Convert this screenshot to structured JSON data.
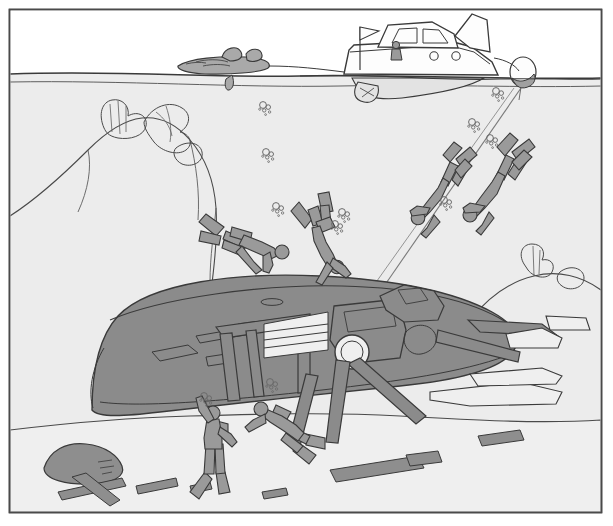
{
  "illustration": {
    "title": "Scuba divers exploring a sunken shipwreck",
    "style": "black-and-white line drawing with gray tonal fills",
    "frame": {
      "name": "picture-border",
      "x": 9,
      "y": 9,
      "width": 592,
      "height": 504,
      "stroke": "#4a4a4a",
      "stroke_width": 1.6,
      "fill": "#ffffff"
    },
    "palette": {
      "sky": "#ffffff",
      "water": "#ececec",
      "water_deep": "#eeeeee",
      "seabed": "#efefef",
      "wreck_fill": "#8b8b8b",
      "wreck_fill_dark": "#7d7d7d",
      "rock_fill": "#8e8e8e",
      "diver_fill": "#9a9a9a",
      "boat_fill": "#fdfdfd",
      "dinghy_fill": "#a9a9a9",
      "buoy_fill": "#a0a0a0",
      "line": "#3a3a3a",
      "line_soft": "#5e5e5e",
      "bubble": "#6a6a6a"
    }
  },
  "regions": [
    {
      "name": "sky-region",
      "label": "Sky above waterline",
      "y_range": [
        10,
        76
      ]
    },
    {
      "name": "water-region",
      "label": "Open water column",
      "y_range": [
        76,
        300
      ]
    },
    {
      "name": "seabed-region",
      "label": "Sea floor",
      "y_range": [
        300,
        512
      ]
    }
  ],
  "surface": {
    "name": "waterline",
    "label": "Water surface line",
    "left_y": 72,
    "right_y": 80,
    "path": "M10,74 C120,70 210,78 300,76 C400,74 500,80 601,78"
  },
  "boat": {
    "name": "dive-boat",
    "label": "Motor cruiser / dive boat",
    "hull_path": "M345,76 L353,47 L356,44 L446,41 L470,47 L490,62 L497,76 Z",
    "cabin_path": "M380,44 L388,26 L432,23 L452,34 L455,45",
    "window_paths": [
      "M392,41 L398,29 L418,28 L418,41 Z",
      "M424,41 L424,29 L440,30 L448,41 Z"
    ],
    "portholes": [
      {
        "cx": 434,
        "cy": 55,
        "r": 4.2
      },
      {
        "cx": 456,
        "cy": 55,
        "r": 4.2
      }
    ],
    "fin_path": "M455,36 L472,16 L486,22 L488,50 L470,47 Z",
    "flag": {
      "mast": "M360,72 L360,28",
      "banner": "M360,28 L378,32 L360,40 Z"
    },
    "person": {
      "name": "boat-skipper",
      "head": {
        "cx": 396,
        "cy": 46,
        "r": 3.4
      },
      "body": "M392,50 L391,60 L401,60 L400,50 Z"
    },
    "underwater_hull": "M352,78 C360,96 372,100 400,97 C430,93 470,86 480,78",
    "propeller": "M360,82 L356,95 L372,97 L376,84",
    "tow_rope": "M290,72 C320,72 336,74 348,74"
  },
  "dinghy": {
    "name": "inflatable-dinghy",
    "label": "Towed inflatable dinghy with gear",
    "hull_path": "M178,66 C190,59 220,57 245,58 C262,59 270,63 268,68 C266,72 230,74 205,73 C188,72 178,70 178,66 Z",
    "gear_paths": [
      "M222,57 C225,48 236,46 240,52 C243,58 238,60 230,60 Z",
      "M246,54 C251,48 260,49 261,55 C262,61 252,62 247,60 Z",
      "M196,63 C204,60 216,60 222,63",
      "M204,66 C212,64 222,64 228,66"
    ],
    "rudder_path": "M232,74 C234,82 232,88 228,89 C225,90 224,84 226,78"
  },
  "buoy": {
    "name": "marker-buoy",
    "label": "Surface marker buoy",
    "ellipse": {
      "cx": 523,
      "cy": 73,
      "rx": 13,
      "ry": 15
    },
    "tether": "M524,88 L520,100",
    "boat_line": "M497,60 C508,62 516,66 520,72"
  },
  "descent_lines": [
    {
      "name": "descent-line-primary",
      "path": "M521,88 L380,292"
    },
    {
      "name": "descent-line-secondary",
      "path": "M514,88 L362,300"
    }
  ],
  "divers": [
    {
      "name": "diver-descending-upper-right",
      "label": "Diver descending head-down on the line",
      "position": [
        500,
        150
      ],
      "orientation": "head-down, finning",
      "body_path": "M508,174 L504,190 L492,206 L486,216 L478,222 L472,216 L480,206 L490,192 L496,176 Z",
      "head": {
        "cx": 471,
        "cy": 214,
        "r": 7
      },
      "tank": "M510,162 L520,152 L527,158 L517,170 Z",
      "fins": [
        "M512,152 L528,140 L534,147 L518,160 Z",
        "M498,148 L510,134 L517,140 L505,156 Z"
      ],
      "arms": [
        "M484,204 L470,202 L464,208",
        "M490,212 L482,224 L476,230"
      ]
    },
    {
      "name": "diver-descending-upper-left",
      "label": "Second diver descending beside the line",
      "position": [
        450,
        160
      ],
      "orientation": "head-down",
      "body_path": "M452,180 L447,196 L438,210 L432,218 L425,222 L420,216 L428,207 L436,194 L442,180 Z",
      "head": {
        "cx": 420,
        "cy": 213,
        "r": 6.6
      },
      "tank": "M454,170 L463,160 L470,166 L460,177 Z",
      "fins": [
        "M456,160 L470,148 L476,155 L462,167 Z",
        "M444,156 L454,143 L461,149 L450,162 Z"
      ],
      "arms": [
        "M430,206 L418,204 L412,210",
        "M434,216 L428,227 L422,232"
      ]
    },
    {
      "name": "diver-swimming-horizontal-mid",
      "label": "Diver swimming horizontally above the wreck",
      "position": [
        250,
        240
      ],
      "orientation": "horizontal, head right",
      "body_path": "M226,232 L244,236 L262,242 L272,246 L276,252 L268,256 L252,250 L234,244 L224,239 Z",
      "head": {
        "cx": 279,
        "cy": 251,
        "r": 7
      },
      "tank": "M232,228 L250,232 L252,240 L234,236 Z",
      "fins": [
        "M222,228 L206,216 L200,224 L216,236 Z",
        "M220,238 L202,234 L200,243 L218,246 Z"
      ],
      "legs": [
        "M224,240 L240,258 L252,266",
        "M232,244 L246,262 L258,268"
      ],
      "arms": [
        "M270,252 L272,264 L268,272"
      ]
    },
    {
      "name": "diver-vertical-mid",
      "label": "Diver swimming head-down toward wreck deck",
      "position": [
        320,
        230
      ],
      "orientation": "head-down, vertical",
      "body_path": "M322,224 L326,240 L332,252 L336,262 L330,268 L322,256 L316,240 L314,226 Z",
      "head": {
        "cx": 334,
        "cy": 266,
        "r": 6.6
      },
      "tank": "M318,222 L330,218 L334,228 L322,232 Z",
      "fins": [
        "M312,220 L300,204 L292,212 L306,228 Z",
        "M322,214 L318,196 L328,194 L332,212 Z"
      ],
      "arms": [
        "M330,258 L342,266 L348,274",
        "M326,262 L320,274 L316,280"
      ]
    },
    {
      "name": "diver-vertical-lower-left",
      "label": "Diver near sea floor with arm raised",
      "position": [
        210,
        430
      ],
      "orientation": "upright, arm raised",
      "body_path": "M208,420 L206,438 L206,454 L210,472 L216,472 L219,454 L220,436 L218,420 Z",
      "head": {
        "cx": 212,
        "cy": 414,
        "r": 7
      },
      "tank": "M216,422 L226,424 L226,438 L218,436 Z",
      "fins": [
        "M206,474 L192,492 L200,498 L212,480 Z",
        "M216,474 L218,494 L228,492 L224,474 Z"
      ],
      "arms": [
        "M208,424 L198,412 L196,400",
        "M220,428 L230,436 L234,444"
      ]
    },
    {
      "name": "diver-horizontal-lower-right",
      "label": "Diver swimming horizontally near sea floor",
      "position": [
        280,
        420
      ],
      "orientation": "horizontal, head left",
      "body_path": "M266,410 L282,416 L296,424 L306,432 L302,440 L288,432 L274,424 L262,417 Z",
      "head": {
        "cx": 262,
        "cy": 408,
        "r": 7
      },
      "tank": "M276,406 L290,412 L286,420 L272,414 Z",
      "fins": [
        "M306,436 L324,440 L324,450 L306,446 Z",
        "M300,444 L316,456 L310,464 L294,452 Z"
      ],
      "legs": [
        "M300,432 L316,440 L324,444",
        "M296,438 L310,450 L316,456"
      ],
      "arms": [
        "M264,414 L252,420 L246,426"
      ]
    }
  ],
  "bubble_clusters": [
    {
      "name": "bubble-cluster-1",
      "cx": 266,
      "cy": 155,
      "scale": 1.0
    },
    {
      "name": "bubble-cluster-2",
      "cx": 276,
      "cy": 208,
      "scale": 0.9
    },
    {
      "name": "bubble-cluster-3",
      "cx": 340,
      "cy": 214,
      "scale": 0.85
    },
    {
      "name": "bubble-cluster-4",
      "cx": 497,
      "cy": 93,
      "scale": 0.85
    },
    {
      "name": "bubble-cluster-5",
      "cx": 474,
      "cy": 124,
      "scale": 0.8
    },
    {
      "name": "bubble-cluster-6",
      "cx": 490,
      "cy": 140,
      "scale": 0.8
    },
    {
      "name": "bubble-cluster-7",
      "cx": 206,
      "cy": 398,
      "scale": 0.8
    },
    {
      "name": "bubble-cluster-8",
      "cx": 272,
      "cy": 385,
      "scale": 0.85
    },
    {
      "name": "bubble-cluster-9",
      "cx": 264,
      "cy": 108,
      "scale": 0.7
    }
  ],
  "wreck": {
    "name": "shipwreck",
    "label": "Sunken ship hull resting on the sea floor",
    "hull_path": "M92,410 C92,380 96,340 118,316 C150,282 240,272 320,276 C400,280 455,292 492,312 C512,323 520,334 516,346 C508,368 460,380 400,386 C330,393 230,404 160,412 C126,416 98,418 92,410 Z",
    "deck_line": "M108,318 C160,296 260,282 340,284 C420,286 472,300 504,320",
    "keel_line": "M100,400 C140,406 230,398 320,388",
    "hull_features": [
      "M150,350 L186,344 L196,352 L158,360 Z",
      "M206,356 L224,354 L226,362 L208,364 Z",
      "M196,336 L252,326 L254,332 L200,342 Z",
      "M238,324 L300,316 L302,322 L240,330 Z"
    ],
    "bow_path": "M92,410 C88,396 90,372 100,352",
    "structures": [
      {
        "name": "wreck-mast-frame",
        "path": "M222,328 L222,400 M300,320 L300,396 M218,326 L306,316 L306,326 L222,336 Z"
      },
      {
        "name": "wreck-beam-diagonal",
        "path": "M234,330 L246,398 M286,322 L294,392"
      },
      {
        "name": "wreck-ladder",
        "path": "M262,322 L262,356 L326,348 L326,312 M262,330 L326,322 M262,338 L326,330 M262,346 L326,338"
      },
      {
        "name": "wreck-hatch-ring",
        "cx": 350,
        "cy": 352,
        "r": 17
      },
      {
        "name": "wreck-superstructure",
        "path": "M336,306 L398,300 L404,332 L398,356 L344,362 L332,340 Z"
      },
      {
        "name": "wreck-davit",
        "path": "M382,296 L404,286 L432,292 L442,306 L436,318 L404,320 Z"
      },
      {
        "name": "wreck-boom-fallen",
        "path": "M352,366 L418,424 L426,418 L362,360 Z"
      },
      {
        "name": "wreck-boom-fallen-2",
        "path": "M338,360 L330,440 L340,440 L350,362 Z"
      },
      {
        "name": "wreck-spar-right",
        "path": "M440,330 L518,352 L520,360 L440,340 Z"
      },
      {
        "name": "wreck-rail-right",
        "path": "M470,322 L540,326 L556,336 L482,332 Z"
      }
    ],
    "debris_right": [
      "M430,392 L520,384 L560,392 L556,402 L470,404 L430,400 Z",
      "M470,376 L540,370 L560,376 L556,382 L478,384 Z",
      "M508,336 L540,330 L560,338 L558,346 L512,346 Z",
      "M546,318 L584,320 L588,330 L550,330 Z"
    ],
    "winch_path": "M404,330 C412,322 426,322 432,330 C438,338 432,350 420,352 C408,354 398,342 404,330 Z"
  },
  "seabed": {
    "name": "sea-floor",
    "label": "Sandy sea floor contour",
    "path": "M10,430 C60,424 120,418 190,416 C260,414 330,412 400,416 C470,420 540,424 601,420 L601,512 L10,512 Z"
  },
  "rocks": [
    {
      "name": "rock-left-ridge",
      "label": "Left rocky ridge with coral",
      "path": "M10,216 C38,198 62,176 88,150 C106,132 124,120 142,118 C160,116 176,124 190,140 C204,156 214,180 216,208 L216,280 L10,280 Z"
    },
    {
      "name": "rock-left-boulder",
      "label": "Boulder on the sea floor",
      "path": "M44,468 C50,452 66,444 84,446 C104,448 116,456 120,466 C124,476 112,482 92,483 C68,484 46,480 44,468 Z"
    },
    {
      "name": "rock-right-ledge",
      "label": "Right rocky ledge",
      "path": "M486,300 C500,286 522,274 546,272 C570,270 592,278 601,290 L601,330 L486,334 Z"
    }
  ],
  "corals": [
    {
      "name": "coral-left-1",
      "path": "M104,128 C98,114 102,102 112,100 C122,98 130,106 128,116 C138,110 148,116 146,126 C144,136 130,140 118,138 C108,136 106,132 104,128 Z"
    },
    {
      "name": "coral-left-2",
      "path": "M144,122 C152,106 170,100 182,108 C192,114 190,126 180,132 C190,134 194,144 186,150 C178,156 162,152 154,142 C148,134 144,128 144,122 Z"
    },
    {
      "name": "coral-left-3",
      "path": "M176,148 C186,140 200,142 202,152 C204,162 192,168 182,164 C174,160 172,152 176,148 Z"
    },
    {
      "name": "coral-right-1",
      "path": "M524,264 C518,254 522,244 532,244 C542,244 546,252 542,260 C550,258 556,264 552,272 C548,280 534,278 528,270 Z"
    },
    {
      "name": "coral-right-2",
      "path": "M560,272 C570,264 584,268 584,278 C584,288 570,292 562,286 C556,282 556,276 560,272 Z"
    }
  ],
  "seaweed_stems": [
    "M88,150 C92,168 88,190 78,212",
    "M190,140 C196,164 200,192 198,220",
    "M216,208 C214,232 210,256 210,280"
  ],
  "debris_floor": [
    {
      "name": "plank-1",
      "path": "M58,492 L122,478 L126,486 L62,500 Z"
    },
    {
      "name": "plank-2",
      "path": "M72,478 L86,474 L120,500 L110,506 Z"
    },
    {
      "name": "plank-3",
      "path": "M136,486 L176,478 L178,486 L138,494 Z"
    },
    {
      "name": "plank-4",
      "path": "M190,486 L210,482 L212,489 L192,493 Z"
    },
    {
      "name": "plank-5",
      "path": "M330,470 L418,456 L424,468 L336,482 Z"
    },
    {
      "name": "plank-6",
      "path": "M406,456 L438,452 L442,462 L410,466 Z"
    },
    {
      "name": "plank-7",
      "path": "M262,492 L286,488 L288,495 L264,499 Z"
    },
    {
      "name": "plank-8",
      "path": "M478,436 L520,430 L524,440 L482,446 Z"
    }
  ]
}
